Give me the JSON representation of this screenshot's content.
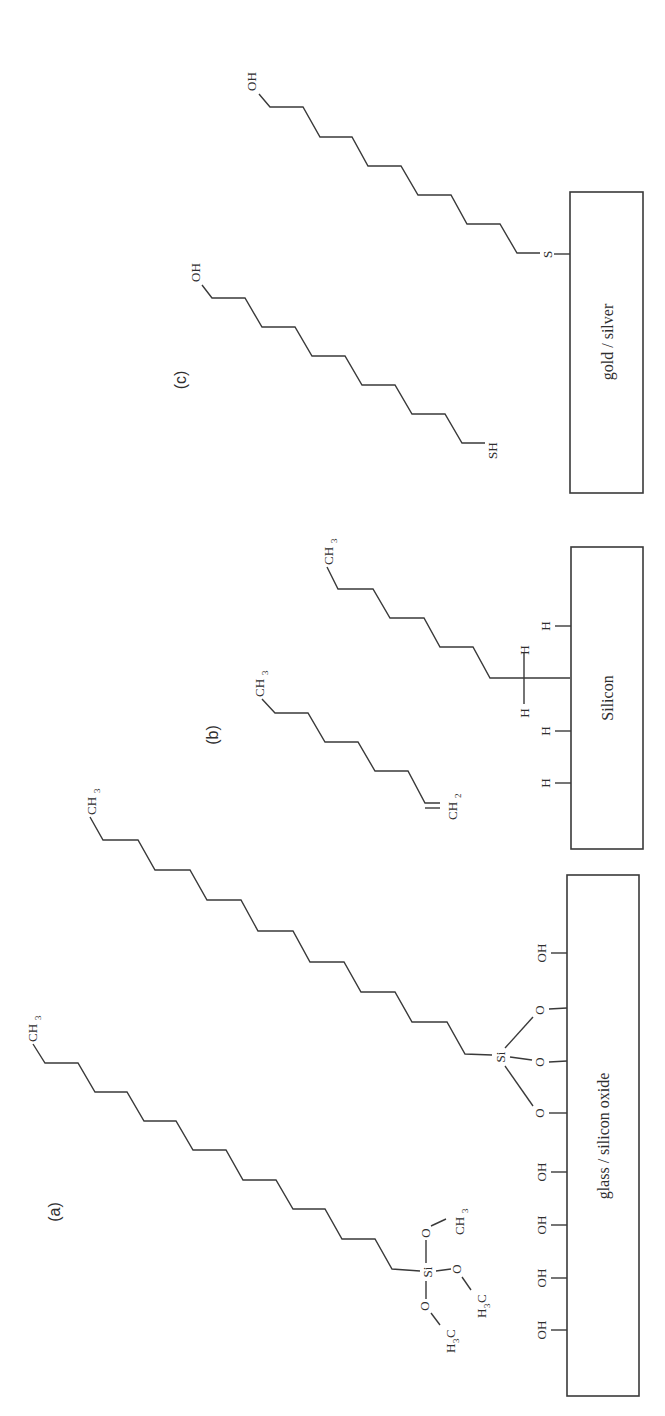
{
  "figure": {
    "orientation": "rotated 90 degrees counter-clockwise",
    "panels": [
      {
        "id": "a",
        "label": "(a)",
        "substrate": "glass / silicon oxide",
        "free_molecule": {
          "tail": "CH3",
          "head": "Si",
          "head_groups": [
            "O–CH3",
            "O–CH3 (H3C)",
            "O–CH3 (H3C)"
          ]
        },
        "bound_molecule": {
          "tail": "CH3",
          "head": "Si",
          "surface_links": [
            "O",
            "O",
            "O"
          ]
        },
        "surface_groups": [
          "OH",
          "OH",
          "OH",
          "OH",
          "OH"
        ]
      },
      {
        "id": "b",
        "label": "(b)",
        "substrate": "Silicon",
        "free_molecule": {
          "tail": "CH3",
          "head": "=CH2"
        },
        "bound_molecule": {
          "tail": "CH3",
          "head_hydrogens": [
            "H",
            "H"
          ]
        },
        "surface_groups": [
          "H",
          "H",
          "H"
        ]
      },
      {
        "id": "c",
        "label": "(c)",
        "substrate": "gold / silver",
        "free_molecule": {
          "tail": "OH",
          "head": "SH"
        },
        "bound_molecule": {
          "tail": "OH",
          "head": "S"
        }
      }
    ]
  },
  "labels": {
    "panel_a": "(a)",
    "panel_b": "(b)",
    "panel_c": "(c)",
    "substrate_a": "glass / silicon oxide",
    "substrate_b": "Silicon",
    "substrate_c": "gold / silver",
    "oh": "OH",
    "sh": "SH",
    "s": "S",
    "si": "Si",
    "o": "O",
    "h": "H",
    "ch": "CH",
    "h3c_h": "H",
    "h3c_c": "C",
    "sub3": "3",
    "sub2": "2"
  },
  "colors": {
    "ink": "#3a3a3a",
    "background": "#ffffff"
  }
}
